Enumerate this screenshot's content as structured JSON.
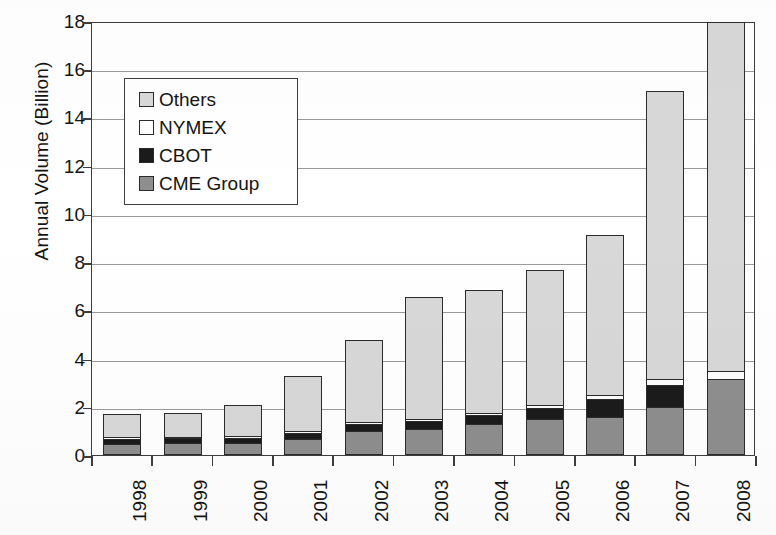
{
  "chart_data": {
    "type": "bar",
    "subtype": "stacked",
    "title": "",
    "xlabel": "",
    "ylabel": "Annual Volume (Billion)",
    "ylim": [
      0,
      18
    ],
    "ytick_step": 2,
    "yticks": [
      "18",
      "16",
      "14",
      "12",
      "10",
      "8",
      "6",
      "4",
      "2",
      "0"
    ],
    "grid": true,
    "legend_position": "upper-left-inset",
    "categories": [
      "1998",
      "1999",
      "2000",
      "2001",
      "2002",
      "2003",
      "2004",
      "2005",
      "2006",
      "2007",
      "2008"
    ],
    "series": [
      {
        "name": "CME Group",
        "color": "#8e8e8e",
        "values": [
          0.42,
          0.45,
          0.46,
          0.63,
          0.95,
          1.05,
          1.25,
          1.45,
          1.55,
          1.95,
          3.1
        ]
      },
      {
        "name": "CBOT",
        "color": "#1b1b1b",
        "values": [
          0.22,
          0.2,
          0.21,
          0.23,
          0.28,
          0.3,
          0.35,
          0.45,
          0.75,
          0.9,
          0.0
        ]
      },
      {
        "name": "NYMEX",
        "color": "#fdfdfd",
        "values": [
          0.05,
          0.05,
          0.06,
          0.08,
          0.08,
          0.1,
          0.12,
          0.12,
          0.15,
          0.25,
          0.35
        ]
      },
      {
        "name": "Others",
        "color": "#d8d8d8",
        "values": [
          0.96,
          1.0,
          1.27,
          2.26,
          3.39,
          5.05,
          5.08,
          5.58,
          6.6,
          11.95,
          14.45
        ]
      }
    ],
    "totals": [
      1.65,
      1.7,
      2.0,
      3.2,
      4.7,
      6.5,
      6.8,
      7.6,
      9.05,
      15.05,
      17.9
    ]
  },
  "legend": {
    "items": [
      {
        "label": "Others",
        "swatch": "#d8d8d8"
      },
      {
        "label": "NYMEX",
        "swatch": "#fdfdfd"
      },
      {
        "label": "CBOT",
        "swatch": "#1b1b1b"
      },
      {
        "label": "CME Group",
        "swatch": "#8e8e8e"
      }
    ]
  }
}
